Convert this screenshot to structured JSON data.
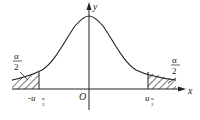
{
  "diagram": {
    "type": "normal-distribution-two-tailed",
    "axes": {
      "x_label": "x",
      "y_label": "y",
      "origin_label": "O"
    },
    "critical_values": {
      "left": {
        "sign": "-",
        "symbol": "u",
        "subscript_num": "α",
        "subscript_den": "2"
      },
      "right": {
        "sign": "",
        "symbol": "u",
        "subscript_num": "α",
        "subscript_den": "2"
      }
    },
    "tail_areas": {
      "left": {
        "numerator": "α",
        "denominator": "2"
      },
      "right": {
        "numerator": "α",
        "denominator": "2"
      }
    },
    "colors": {
      "line": "#222222",
      "background": "#ffffff"
    }
  }
}
